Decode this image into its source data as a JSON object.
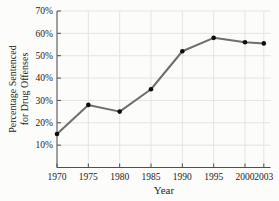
{
  "chart_data": {
    "type": "line",
    "title": "",
    "xlabel": "Year",
    "ylabel": "Percentage Sentenced for Drug Offenses",
    "ylabel_lines": [
      "Percentage Sentenced",
      "for Drug Offenses"
    ],
    "x": [
      1970,
      1975,
      1980,
      1985,
      1990,
      1995,
      2000,
      2003
    ],
    "x_tick_labels": [
      "1970",
      "1975",
      "1980",
      "1985",
      "1990",
      "1995",
      "2000",
      "2003"
    ],
    "values": [
      15,
      28,
      25,
      35,
      52,
      58,
      56,
      55.5
    ],
    "ylim": [
      0,
      70
    ],
    "y_ticks": [
      10,
      20,
      30,
      40,
      50,
      60,
      70
    ],
    "y_tick_labels": [
      "10%",
      "20%",
      "30%",
      "40%",
      "50%",
      "60%",
      "70%"
    ],
    "grid": true,
    "legend": false,
    "marker": "filled-circle",
    "colors": {
      "line": "#6e6e6e",
      "marker": "#0d0d0d",
      "grid": "#e4e4e3",
      "axis": "#4f4f4f",
      "text": "#242424",
      "background": "#fcfcfb"
    }
  }
}
